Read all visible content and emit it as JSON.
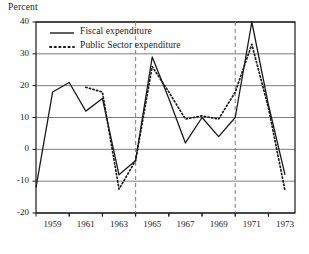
{
  "chart_data": {
    "type": "line",
    "title": "",
    "ylabel": "Percent",
    "xlabel": "",
    "ylim": [
      -20,
      40
    ],
    "xlim": [
      1958,
      1973.6
    ],
    "grid": true,
    "y_ticks": [
      40,
      30,
      20,
      10,
      0,
      -10,
      -20
    ],
    "y_tick_labels": [
      "40",
      "30",
      "20",
      "10",
      "0",
      "-10",
      "-20"
    ],
    "x_ticks": [
      1959,
      1961,
      1963,
      1965,
      1967,
      1969,
      1971,
      1973
    ],
    "x_tick_labels": [
      "1959",
      "1961",
      "1963",
      "1965",
      "1967",
      "1969",
      "1971",
      "1973"
    ],
    "legend_position": "upper-left",
    "annotations": [
      {
        "type": "vline",
        "x": 1964,
        "style": "dashed"
      },
      {
        "type": "vline",
        "x": 1970,
        "style": "dashed"
      }
    ],
    "series": [
      {
        "name": "Fiscal expenditure",
        "style": "solid",
        "color": "#1a1a1a",
        "x": [
          1958,
          1959,
          1960,
          1961,
          1962,
          1963,
          1964,
          1965,
          1966,
          1967,
          1968,
          1969,
          1970,
          1971,
          1972,
          1973
        ],
        "values": [
          -12,
          18,
          21,
          12,
          16,
          -8,
          -3.5,
          29,
          16,
          2,
          10,
          4,
          10,
          40,
          14,
          -8
        ]
      },
      {
        "name": "Public Sector expenditure",
        "style": "dotted",
        "color": "#1a1a1a",
        "x": [
          1961,
          1962,
          1963,
          1964,
          1965,
          1966,
          1967,
          1968,
          1969,
          1970,
          1971,
          1972,
          1973
        ],
        "values": [
          19.5,
          18,
          -12.5,
          -3.5,
          26,
          18,
          9.5,
          10.5,
          9.5,
          18,
          33,
          13,
          -13
        ]
      }
    ]
  },
  "legend": {
    "items": [
      {
        "label": "Fiscal expenditure",
        "style": "solid"
      },
      {
        "label": "Public Sector expenditure",
        "style": "dotted"
      }
    ]
  },
  "colors": {
    "axis": "#1a1a1a",
    "grid": "#6e6e6e",
    "series": "#1a1a1a",
    "vline": "#8a8a8a",
    "background": "#ffffff"
  }
}
